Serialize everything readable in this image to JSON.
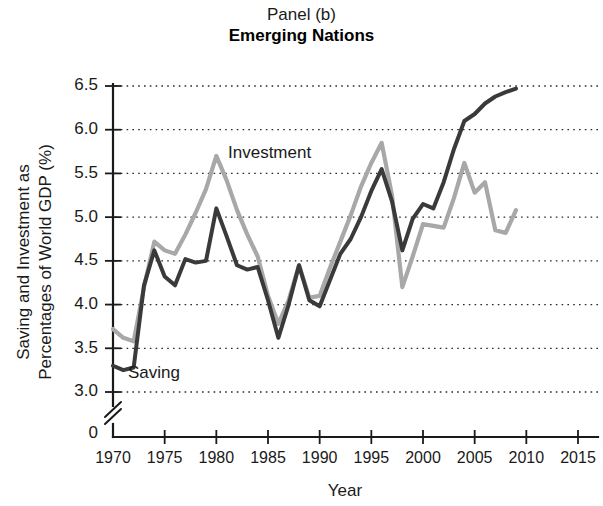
{
  "title": {
    "line1": "Panel (b)",
    "line2": "Emerging Nations"
  },
  "axes": {
    "ylabel_line1": "Saving and Investment as",
    "ylabel_line2": "Percentages of World GDP (%)",
    "xlabel": "Year",
    "yticks": [
      "0",
      "3.0",
      "3.5",
      "4.0",
      "4.5",
      "5.0",
      "5.5",
      "6.0",
      "6.5"
    ],
    "xticks": [
      "1970",
      "1975",
      "1980",
      "1985",
      "1990",
      "1995",
      "2000",
      "2005",
      "2010",
      "2015"
    ],
    "axis_break_note": "y-axis broken between 0 and 3.0"
  },
  "annotations": {
    "investment_label": "Investment",
    "saving_label": "Saving"
  },
  "colors": {
    "saving_line": "#3a3a3a",
    "investment_line": "#a8a8a8",
    "axis": "#1a1a1a",
    "grid": "#2a2a2a",
    "background": "#ffffff"
  },
  "chart_data": {
    "type": "line",
    "title": "Panel (b) Emerging Nations",
    "xlabel": "Year",
    "ylabel": "Saving and Investment as Percentages of World GDP (%)",
    "xlim": [
      1970,
      2015
    ],
    "ylim": [
      3.0,
      6.5
    ],
    "y_axis_break": true,
    "y_axis_break_from": 0,
    "y_axis_break_to": 3.0,
    "ytick_values": [
      3.0,
      3.5,
      4.0,
      4.5,
      5.0,
      5.5,
      6.0,
      6.5
    ],
    "xtick_values": [
      1970,
      1975,
      1980,
      1985,
      1990,
      1995,
      2000,
      2005,
      2010,
      2015
    ],
    "grid": "horizontal-dotted",
    "legend": "inline-annotations",
    "x": [
      1970,
      1971,
      1972,
      1973,
      1974,
      1975,
      1976,
      1977,
      1978,
      1979,
      1980,
      1981,
      1982,
      1983,
      1984,
      1985,
      1986,
      1987,
      1988,
      1989,
      1990,
      1991,
      1992,
      1993,
      1994,
      1995,
      1996,
      1997,
      1998,
      1999,
      2000,
      2001,
      2002,
      2003,
      2004,
      2005,
      2006,
      2007,
      2008,
      2009
    ],
    "series": [
      {
        "name": "Saving",
        "color": "#3a3a3a",
        "values": [
          3.3,
          3.25,
          3.28,
          4.22,
          4.62,
          4.32,
          4.22,
          4.52,
          4.48,
          4.5,
          5.1,
          4.78,
          4.45,
          4.4,
          4.43,
          4.05,
          3.62,
          4.0,
          4.45,
          4.05,
          3.98,
          4.28,
          4.58,
          4.75,
          5.0,
          5.3,
          5.55,
          5.18,
          4.62,
          4.98,
          5.15,
          5.1,
          5.4,
          5.78,
          6.1,
          6.18,
          6.3,
          6.38,
          6.43,
          6.47
        ]
      },
      {
        "name": "Investment",
        "color": "#a8a8a8",
        "values": [
          3.72,
          3.62,
          3.58,
          4.2,
          4.72,
          4.62,
          4.58,
          4.8,
          5.05,
          5.32,
          5.7,
          5.42,
          5.08,
          4.8,
          4.55,
          4.1,
          3.78,
          4.05,
          4.45,
          4.08,
          4.1,
          4.42,
          4.72,
          5.02,
          5.35,
          5.62,
          5.85,
          5.25,
          4.2,
          4.55,
          4.92,
          4.9,
          4.88,
          5.22,
          5.62,
          5.28,
          5.4,
          4.85,
          4.82,
          5.08
        ]
      }
    ]
  }
}
